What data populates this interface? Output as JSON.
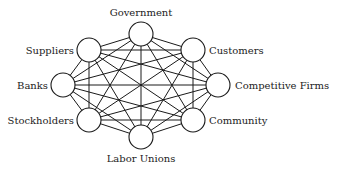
{
  "diagram": {
    "type": "complete-graph",
    "colors": {
      "line": "#1a1a1a",
      "node_fill": "#ffffff",
      "text": "#222222"
    },
    "node_radius": 12,
    "nodes": [
      {
        "id": "government",
        "label": "Government",
        "x": 141,
        "y": 34,
        "lx": 141,
        "ly": 16,
        "anchor": "middle"
      },
      {
        "id": "customers",
        "label": "Customers",
        "x": 193,
        "y": 50,
        "lx": 209,
        "ly": 54,
        "anchor": "start"
      },
      {
        "id": "competitive-firms",
        "label": "Competitive Firms",
        "x": 218,
        "y": 85,
        "lx": 235,
        "ly": 89,
        "anchor": "start"
      },
      {
        "id": "community",
        "label": "Community",
        "x": 193,
        "y": 120,
        "lx": 209,
        "ly": 124,
        "anchor": "start"
      },
      {
        "id": "labor-unions",
        "label": "Labor Unions",
        "x": 141,
        "y": 137,
        "lx": 141,
        "ly": 162,
        "anchor": "middle"
      },
      {
        "id": "stockholders",
        "label": "Stockholders",
        "x": 89,
        "y": 120,
        "lx": 74,
        "ly": 124,
        "anchor": "end"
      },
      {
        "id": "banks",
        "label": "Banks",
        "x": 63,
        "y": 85,
        "lx": 48,
        "ly": 89,
        "anchor": "end"
      },
      {
        "id": "suppliers",
        "label": "Suppliers",
        "x": 89,
        "y": 50,
        "lx": 74,
        "ly": 54,
        "anchor": "end"
      }
    ]
  }
}
